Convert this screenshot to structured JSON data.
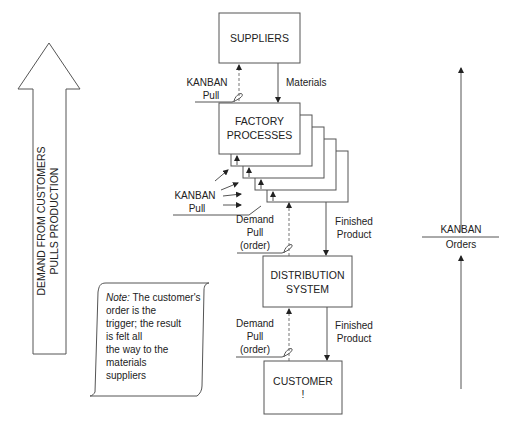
{
  "big_arrow": {
    "line1": "DEMAND FROM CUSTOMERS",
    "line2": "PULLS PRODUCTION"
  },
  "boxes": {
    "suppliers": "SUPPLIERS",
    "factory_line1": "FACTORY",
    "factory_line2": "PROCESSES",
    "distribution_line1": "DISTRIBUTION",
    "distribution_line2": "SYSTEM",
    "customer_line1": "CUSTOMER",
    "customer_line2": "!"
  },
  "labels": {
    "materials": "Materials",
    "kanban_pull_top_1": "KANBAN",
    "kanban_pull_top_2": "Pull",
    "kanban_pull_mid_1": "KANBAN",
    "kanban_pull_mid_2": "Pull",
    "demand_pull_1_a": "Demand",
    "demand_pull_1_b": "Pull",
    "demand_pull_1_c": "(order)",
    "finished_product_1_a": "Finished",
    "finished_product_1_b": "Product",
    "demand_pull_2_a": "Demand",
    "demand_pull_2_b": "Pull",
    "demand_pull_2_c": "(order)",
    "finished_product_2_a": "Finished",
    "finished_product_2_b": "Product"
  },
  "note": {
    "prefix": "Note:",
    "line1_rest": " The customer's",
    "line2": "order is the",
    "line3": "trigger; the result",
    "line4": "is felt all",
    "line5": "the way to the",
    "line6": "materials",
    "line7": "suppliers"
  },
  "right_axis": {
    "top": "KANBAN",
    "bottom": "Orders"
  }
}
